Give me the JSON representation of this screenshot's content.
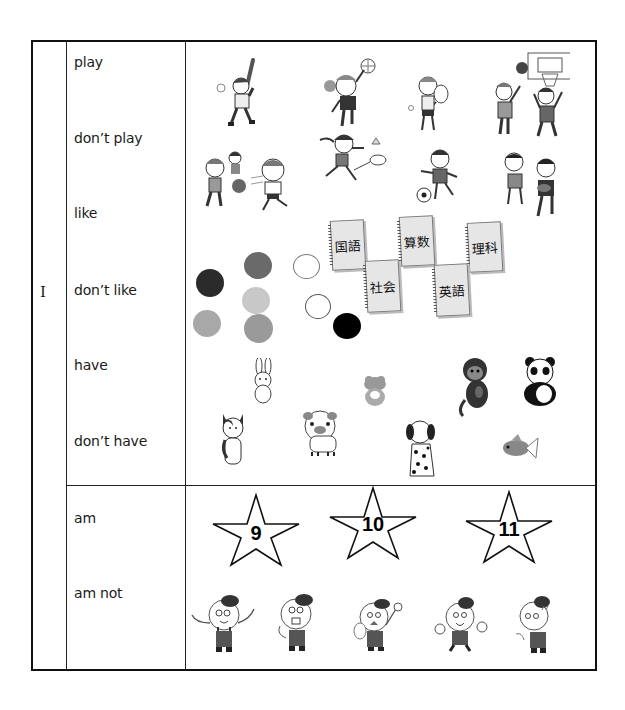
{
  "worksheet": {
    "subject": "I",
    "sections": [
      {
        "id": "verbs",
        "rows": [
          {
            "label": "play"
          },
          {
            "label": "don’t play"
          },
          {
            "label": "like"
          },
          {
            "label": "don’t like"
          },
          {
            "label": "have"
          },
          {
            "label": "don’t have"
          }
        ],
        "pictures": {
          "sports": [
            "baseball",
            "volleyball",
            "tennis",
            "basketball",
            "dodgeball",
            "badminton",
            "soccer",
            "rugby"
          ],
          "colors": [
            {
              "name": "black",
              "hex": "#2b2b2b"
            },
            {
              "name": "dark-gray",
              "hex": "#6a6a6a"
            },
            {
              "name": "white",
              "hex": "#ffffff"
            },
            {
              "name": "light-gray",
              "hex": "#c8c8c8"
            },
            {
              "name": "white-2",
              "hex": "#ffffff"
            },
            {
              "name": "gray",
              "hex": "#a8a8a8"
            },
            {
              "name": "mid-gray",
              "hex": "#9a9a9a"
            },
            {
              "name": "black-2",
              "hex": "#000000"
            }
          ],
          "subjects": [
            "国語",
            "算数",
            "理科",
            "社会",
            "英語"
          ],
          "animals": [
            "rabbit",
            "frog",
            "monkey",
            "panda",
            "cat",
            "pig",
            "dalmatian",
            "goldfish"
          ]
        }
      },
      {
        "id": "be-verb",
        "rows": [
          {
            "label": "am"
          },
          {
            "label": "am not"
          }
        ],
        "pictures": {
          "stars": [
            "9",
            "10",
            "11"
          ],
          "characters": [
            "waving-boy",
            "surprised-boy",
            "angry-boy",
            "cheering-boy",
            "worried-boy"
          ]
        }
      }
    ]
  }
}
